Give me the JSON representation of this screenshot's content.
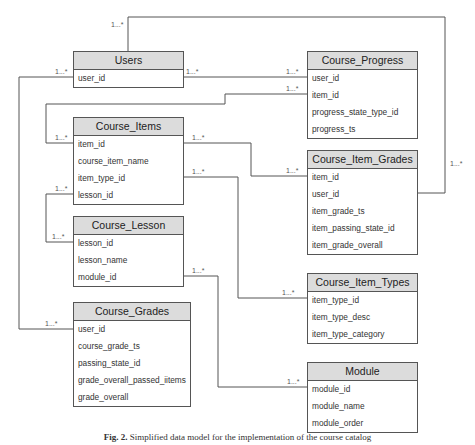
{
  "diagram": {
    "type": "er-diagram",
    "entities": {
      "users": {
        "title": "Users",
        "fields": [
          "user_id"
        ]
      },
      "course_progress": {
        "title": "Course_Progress",
        "fields": [
          "user_id",
          "item_id",
          "progress_state_type_id",
          "progress_ts"
        ]
      },
      "course_items": {
        "title": "Course_Items",
        "fields": [
          "item_id",
          "course_item_name",
          "item_type_id",
          "lesson_id"
        ]
      },
      "course_item_grades": {
        "title": "Course_Item_Grades",
        "fields": [
          "item_id",
          "user_id",
          "item_grade_ts",
          "item_passing_state_id",
          "item_grade_overall"
        ]
      },
      "course_lesson": {
        "title": "Course_Lesson",
        "fields": [
          "lesson_id",
          "lesson_name",
          "module_id"
        ]
      },
      "course_item_types": {
        "title": "Course_Item_Types",
        "fields": [
          "item_type_id",
          "item_type_desc",
          "item_type_category"
        ]
      },
      "course_grades": {
        "title": "Course_Grades",
        "fields": [
          "user_id",
          "course_grade_ts",
          "passing_state_id",
          "grade_overall_passed_iitems",
          "grade_overall"
        ]
      },
      "module": {
        "title": "Module",
        "fields": [
          "module_id",
          "module_name",
          "module_order"
        ]
      }
    },
    "cardinality_label": "1...*",
    "relationships": [
      {
        "from": "Users.user_id",
        "to": "Course_Progress.user_id",
        "label": "1...*"
      },
      {
        "from": "Users.user_id",
        "to": "Course_Item_Grades.user_id",
        "label": "1...*"
      },
      {
        "from": "Users.user_id",
        "to": "Course_Grades.user_id",
        "label": "1...*"
      },
      {
        "from": "Course_Items.item_id",
        "to": "Course_Progress.item_id",
        "label": "1...*"
      },
      {
        "from": "Course_Items.item_id",
        "to": "Course_Item_Grades.item_id",
        "label": "1...*"
      },
      {
        "from": "Course_Items.item_type_id",
        "to": "Course_Item_Types.item_type_id",
        "label": "1...*"
      },
      {
        "from": "Course_Items.lesson_id",
        "to": "Course_Lesson.lesson_id",
        "label": "1...*"
      },
      {
        "from": "Course_Lesson.module_id",
        "to": "Module.module_id",
        "label": "1...*"
      }
    ],
    "caption": {
      "prefix": "Fig. 2.",
      "text": "Simplified data model for the implementation of the course catalog"
    },
    "colors": {
      "header_bg": "#dcdcdc",
      "border": "#555555",
      "line": "#555555"
    }
  }
}
